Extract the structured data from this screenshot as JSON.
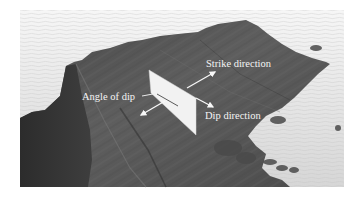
{
  "figure": {
    "type": "annotated-photograph",
    "labels": {
      "strike": "Strike direction",
      "angle": "Angle of dip",
      "dip": "Dip direction"
    },
    "colors": {
      "background": "#ffffff",
      "sea": "#e2e2e2",
      "rock_dark": "#3a3a3a",
      "rock_mid": "#5c5c5c",
      "plane": "#f2f2f2",
      "arrow": "#f8f8f8",
      "label_text": "#f4f4f4"
    }
  }
}
